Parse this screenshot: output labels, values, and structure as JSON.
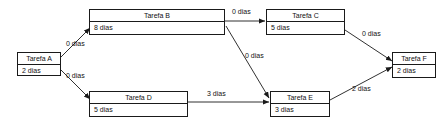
{
  "diagram": {
    "unit_label": "dias",
    "line_color": "#1a1a1a",
    "background_color": "#ffffff",
    "text_color": "#111111",
    "nodes": [
      {
        "id": "A",
        "name": "Tarefa A",
        "duration": "2   dias"
      },
      {
        "id": "B",
        "name": "Tarefa B",
        "duration": "8   dias"
      },
      {
        "id": "C",
        "name": "Tarefa C",
        "duration": "5   dias"
      },
      {
        "id": "D",
        "name": "Tarefa D",
        "duration": "5   dias"
      },
      {
        "id": "E",
        "name": "Tarefa E",
        "duration": "3   dias"
      },
      {
        "id": "F",
        "name": "Tarefa F",
        "duration": "2   dias"
      }
    ],
    "edges": [
      {
        "id": "A-B",
        "from": "Tarefa A",
        "to": "Tarefa B",
        "label": "0 dias"
      },
      {
        "id": "A-D",
        "from": "Tarefa A",
        "to": "Tarefa D",
        "label": "0 dias"
      },
      {
        "id": "B-C",
        "from": "Tarefa B",
        "to": "Tarefa C",
        "label": "0 dias"
      },
      {
        "id": "B-E",
        "from": "Tarefa B",
        "to": "Tarefa E",
        "label": "0 dias"
      },
      {
        "id": "D-E",
        "from": "Tarefa D",
        "to": "Tarefa E",
        "label": "3 dias"
      },
      {
        "id": "C-F",
        "from": "Tarefa C",
        "to": "Tarefa F",
        "label": "0 dias"
      },
      {
        "id": "E-F",
        "from": "Tarefa E",
        "to": "Tarefa F",
        "label": "2 dias"
      }
    ]
  }
}
